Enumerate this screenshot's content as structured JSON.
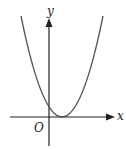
{
  "diagram": {
    "type": "function-graph",
    "curve": "parabola opening upward, vertex on positive x-axis",
    "labels": {
      "x_axis": "x",
      "y_axis": "y",
      "origin": "O"
    },
    "colors": {
      "axes": "#222222",
      "curve": "#555555",
      "background": "#ffffff"
    }
  }
}
